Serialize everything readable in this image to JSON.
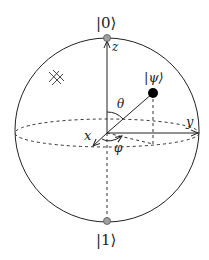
{
  "diagram": {
    "labels": {
      "ket0": "|0⟩",
      "ket1": "|1⟩",
      "psi": "|ψ⟩",
      "z_axis": "z",
      "y_axis": "y",
      "x_axis": "x",
      "theta": "θ",
      "phi": "φ"
    },
    "colors": {
      "line": "#222222",
      "pole_fill": "#a0a0a0",
      "state_point": "#000000"
    }
  }
}
